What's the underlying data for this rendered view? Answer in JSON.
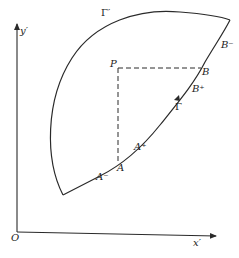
{
  "figure": {
    "axes": {
      "origin_label": "O",
      "x_label": "x′",
      "y_label": "y′"
    },
    "curves": {
      "gamma_label": "Γ",
      "gamma_prime_label": "Γ′"
    },
    "points": {
      "P": "P",
      "A": "A",
      "A_minus": "A⁻",
      "A_plus": "A⁺",
      "B": "B",
      "B_minus": "B⁻",
      "B_plus": "B⁺"
    },
    "colors": {
      "stroke": "#2a2a2a",
      "background": "#ffffff"
    }
  }
}
